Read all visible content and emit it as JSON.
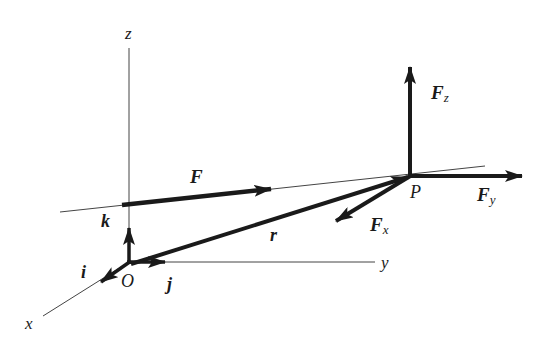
{
  "diagram": {
    "colors": {
      "ink": "#1a1a1a",
      "thin_line": "#333333",
      "background": "#ffffff"
    },
    "axes": {
      "x_label": "x",
      "y_label": "y",
      "z_label": "z",
      "origin_label": "O"
    },
    "unit_vectors": {
      "i_label": "i",
      "j_label": "j",
      "k_label": "k"
    },
    "point_label": "P",
    "vectors": {
      "force_label": "F",
      "position_label": "r",
      "components": [
        {
          "base": "F",
          "subscript": "x"
        },
        {
          "base": "F",
          "subscript": "y"
        },
        {
          "base": "F",
          "subscript": "z"
        }
      ]
    }
  }
}
